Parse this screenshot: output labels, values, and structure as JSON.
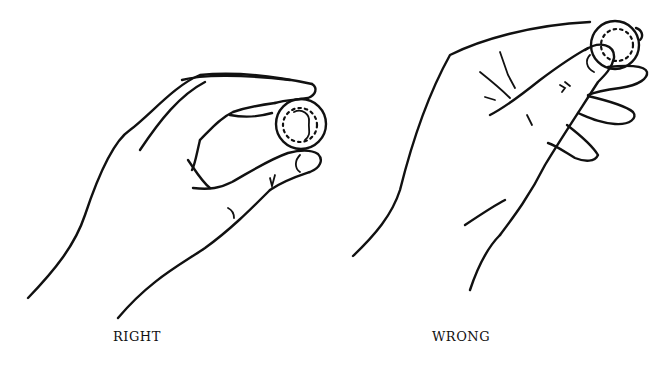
{
  "figure": {
    "panels": [
      {
        "id": "right",
        "label": "RIGHT",
        "description": "Coin held gently between thumb and fingertips",
        "coin_center": [
          301,
          124
        ],
        "coin_radius": 25
      },
      {
        "id": "wrong",
        "label": "WRONG",
        "description": "Coin pressed under thumb tip with fingers curled",
        "coin_center": [
          615,
          45
        ],
        "coin_radius": 24
      }
    ],
    "colors": {
      "ink": "#111111",
      "background": "#ffffff"
    }
  }
}
